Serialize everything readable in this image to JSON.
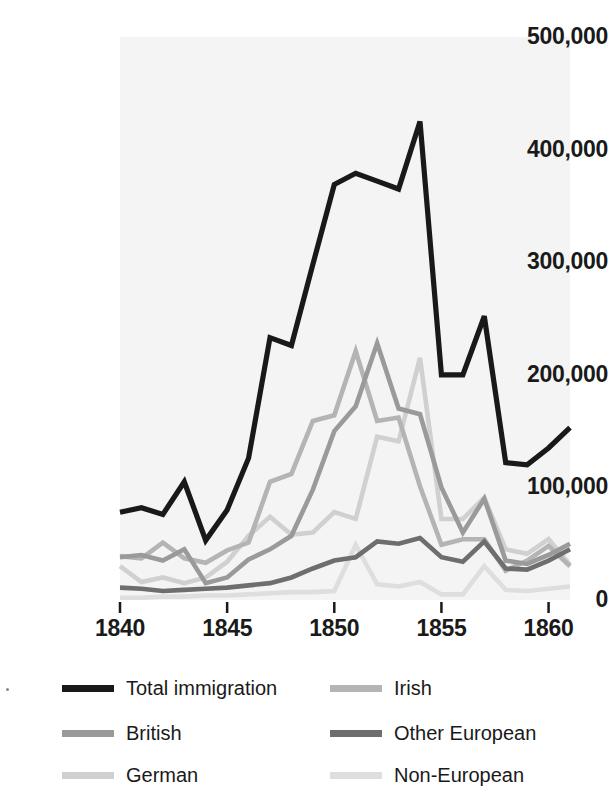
{
  "chart_data": {
    "type": "line",
    "title": "",
    "subtitle": "",
    "xlabel": "",
    "ylabel": "",
    "xlim": [
      1840,
      1861
    ],
    "ylim": [
      0,
      500000
    ],
    "grid": false,
    "legend_position": "bottom",
    "x": [
      1840,
      1841,
      1842,
      1843,
      1844,
      1845,
      1846,
      1847,
      1848,
      1849,
      1850,
      1851,
      1852,
      1853,
      1854,
      1855,
      1856,
      1857,
      1858,
      1859,
      1860,
      1861
    ],
    "y_ticks": [
      0,
      100000,
      200000,
      300000,
      400000,
      500000
    ],
    "y_tick_labels": [
      "0",
      "100,000",
      "200,000",
      "300,000",
      "400,000",
      "500,000"
    ],
    "x_ticks": [
      1840,
      1845,
      1850,
      1855,
      1860
    ],
    "x_tick_labels": [
      "1840",
      "1845",
      "1850",
      "1855",
      "1860"
    ],
    "series": [
      {
        "name": "Total immigration",
        "color": "#191919",
        "values": [
          78000,
          82000,
          76000,
          105000,
          53000,
          80000,
          126000,
          233000,
          226000,
          298000,
          369000,
          379000,
          372000,
          365000,
          425000,
          200000,
          200000,
          252000,
          122000,
          120000,
          135000,
          153000
        ]
      },
      {
        "name": "British",
        "color": "#9a9a9a",
        "values": [
          38000,
          40000,
          35000,
          45000,
          15000,
          20000,
          36000,
          45000,
          57000,
          98000,
          150000,
          172000,
          228000,
          170000,
          165000,
          100000,
          60000,
          90000,
          35000,
          32000,
          40000,
          50000
        ]
      },
      {
        "name": "German",
        "color": "#d0d0d0",
        "values": [
          30000,
          16000,
          20000,
          15000,
          20000,
          34000,
          57000,
          74000,
          58000,
          60000,
          78000,
          72000,
          145000,
          141000,
          215000,
          72000,
          72000,
          91000,
          45000,
          41000,
          54000,
          31000
        ]
      },
      {
        "name": "Irish",
        "color": "#b4b4b4",
        "values": [
          39000,
          37000,
          51000,
          37000,
          33000,
          44000,
          51000,
          105000,
          112000,
          159000,
          164000,
          221000,
          159000,
          162000,
          101000,
          49000,
          54000,
          54000,
          26000,
          35000,
          48000,
          30000
        ]
      },
      {
        "name": "Other European",
        "color": "#6e6e6e",
        "values": [
          11000,
          10000,
          8000,
          9000,
          10000,
          11000,
          13000,
          15000,
          20000,
          28000,
          35000,
          38000,
          52000,
          50000,
          55000,
          38000,
          34000,
          52000,
          28000,
          27000,
          35000,
          45000
        ]
      },
      {
        "name": "Non-European",
        "color": "#dedede",
        "values": [
          2000,
          2000,
          3000,
          3000,
          4000,
          4000,
          5000,
          6000,
          7000,
          7000,
          8000,
          49000,
          14000,
          12000,
          16000,
          5000,
          5000,
          30000,
          9000,
          8000,
          10000,
          12000
        ]
      }
    ]
  },
  "legend": {
    "items": [
      {
        "label": "Total immigration",
        "color": "#191919"
      },
      {
        "label": "British",
        "color": "#9a9a9a"
      },
      {
        "label": "German",
        "color": "#d0d0d0"
      },
      {
        "label": "Irish",
        "color": "#b4b4b4"
      },
      {
        "label": "Other European",
        "color": "#6e6e6e"
      },
      {
        "label": "Non-European",
        "color": "#dedede"
      }
    ]
  },
  "icons": {
    "legend_swatch": "line-swatch-icon",
    "stray_mark": "stray-dot-icon"
  }
}
